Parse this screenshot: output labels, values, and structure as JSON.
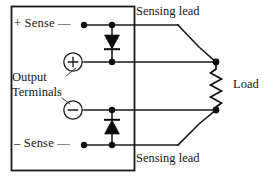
{
  "diagram": {
    "type": "electrical-schematic",
    "labels": {
      "plus_sense": "+ Sense —",
      "minus_sense": "– Sense —",
      "output_terminals_line1": "Output",
      "output_terminals_line2": "Terminals",
      "sensing_lead_top": "Sensing lead",
      "sensing_lead_bottom": "Sensing lead",
      "load": "Load"
    },
    "terminals": [
      {
        "name": "positive-output-terminal",
        "glyph": "plus-circle-icon",
        "symbol": "+"
      },
      {
        "name": "negative-output-terminal",
        "glyph": "minus-circle-icon",
        "symbol": "−"
      }
    ],
    "components": [
      {
        "name": "upper-protection-diode",
        "type": "diode",
        "orientation": "cathode-down"
      },
      {
        "name": "lower-protection-diode",
        "type": "diode",
        "orientation": "cathode-up"
      },
      {
        "name": "load-resistor",
        "type": "resistor",
        "label": "Load"
      }
    ],
    "colors": {
      "line": "#1a1a1a",
      "fill": "#0d0d0d",
      "background": "#ffffff",
      "text": "#151515"
    }
  }
}
